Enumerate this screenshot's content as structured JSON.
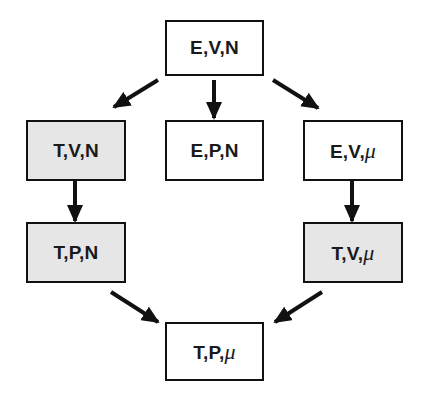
{
  "diagram": {
    "type": "ensemble-transformation-graph",
    "colors": {
      "border": "#111111",
      "arrow": "#111111",
      "shaded_fill": "#e6e6e6",
      "plain_fill": "#ffffff",
      "text": "#1a1a1a"
    },
    "nodes": [
      {
        "id": "EVN",
        "parts": [
          "E",
          "V",
          "N"
        ],
        "shaded": false,
        "label": "E,V,N"
      },
      {
        "id": "TVN",
        "parts": [
          "T",
          "V",
          "N"
        ],
        "shaded": true,
        "label": "T,V,N"
      },
      {
        "id": "EPN",
        "parts": [
          "E",
          "P",
          "N"
        ],
        "shaded": false,
        "label": "E,P,N"
      },
      {
        "id": "EVmu",
        "parts": [
          "E",
          "V",
          "μ"
        ],
        "shaded": false,
        "label": "E,V,μ"
      },
      {
        "id": "TPN",
        "parts": [
          "T",
          "P",
          "N"
        ],
        "shaded": true,
        "label": "T,P,N"
      },
      {
        "id": "TVmu",
        "parts": [
          "T",
          "V",
          "μ"
        ],
        "shaded": true,
        "label": "T,V,μ"
      },
      {
        "id": "TPmu",
        "parts": [
          "T",
          "P",
          "μ"
        ],
        "shaded": false,
        "label": "T,P,μ"
      }
    ],
    "edges": [
      {
        "from": "EVN",
        "to": "TVN"
      },
      {
        "from": "EVN",
        "to": "EPN"
      },
      {
        "from": "EVN",
        "to": "EVmu"
      },
      {
        "from": "TVN",
        "to": "TPN"
      },
      {
        "from": "EVmu",
        "to": "TVmu"
      },
      {
        "from": "TPN",
        "to": "TPmu"
      },
      {
        "from": "TVmu",
        "to": "TPmu"
      }
    ],
    "text": {
      "sep": ",",
      "EVN": {
        "a": "E",
        "b": "V",
        "c": "N"
      },
      "TVN": {
        "a": "T",
        "b": "V",
        "c": "N"
      },
      "EPN": {
        "a": "E",
        "b": "P",
        "c": "N"
      },
      "EVmu": {
        "a": "E",
        "b": "V",
        "c": "μ"
      },
      "TPN": {
        "a": "T",
        "b": "P",
        "c": "N"
      },
      "TVmu": {
        "a": "T",
        "b": "V",
        "c": "μ"
      },
      "TPmu": {
        "a": "T",
        "b": "P",
        "c": "μ"
      }
    }
  }
}
